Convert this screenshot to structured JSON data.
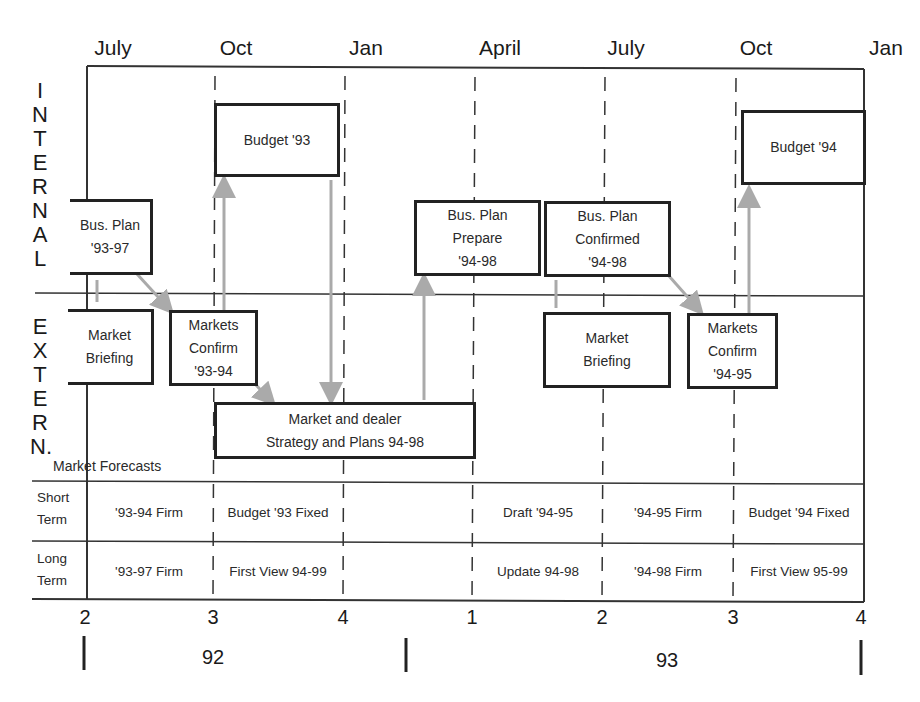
{
  "timeline": {
    "months": [
      {
        "label": "July",
        "x": 113
      },
      {
        "label": "Oct",
        "x": 236
      },
      {
        "label": "Jan",
        "x": 366
      },
      {
        "label": "April",
        "x": 500
      },
      {
        "label": "July",
        "x": 626
      },
      {
        "label": "Oct",
        "x": 756
      },
      {
        "label": "Jan",
        "x": 886
      }
    ],
    "quarters": [
      {
        "label": "2",
        "x": 85
      },
      {
        "label": "3",
        "x": 213
      },
      {
        "label": "4",
        "x": 343
      },
      {
        "label": "1",
        "x": 472
      },
      {
        "label": "2",
        "x": 602
      },
      {
        "label": "3",
        "x": 733
      },
      {
        "label": "4",
        "x": 861
      }
    ],
    "years": [
      {
        "label": "92",
        "x": 213
      },
      {
        "label": "93",
        "x": 667
      }
    ]
  },
  "sections": {
    "internal": [
      "I",
      "N",
      "T",
      "E",
      "R",
      "N",
      "A",
      "L"
    ],
    "external": [
      "E",
      "X",
      "T",
      "E",
      "R",
      "N."
    ]
  },
  "boxes": {
    "bus_plan_93_97": "Bus. Plan\n'93-97",
    "budget_93": "Budget '93",
    "bus_plan_prepare": "Bus. Plan\nPrepare\n'94-98",
    "bus_plan_confirmed": "Bus. Plan\nConfirmed\n'94-98",
    "budget_94": "Budget '94",
    "market_briefing_1": "Market\nBriefing",
    "markets_confirm_93_94": "Markets\nConfirm\n'93-94",
    "market_dealer_strategy": "Market and dealer\nStrategy and Plans 94-98",
    "market_briefing_2": "Market\nBriefing",
    "markets_confirm_94_95": "Markets\nConfirm\n'94-95"
  },
  "forecasts": {
    "title": "Market Forecasts",
    "short_term": {
      "label": "Short\nTerm",
      "cells": [
        "'93-94 Firm",
        "Budget '93 Fixed",
        "Draft '94-95",
        "'94-95 Firm",
        "Budget '94 Fixed"
      ]
    },
    "long_term": {
      "label": "Long\nTerm",
      "cells": [
        "'93-97 Firm",
        "First View 94-99",
        "Update 94-98",
        "'94-98 Firm",
        "First View 95-99"
      ]
    }
  }
}
